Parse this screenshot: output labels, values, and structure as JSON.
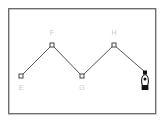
{
  "figure": {
    "background_color": "#ffffff",
    "frame": {
      "name": "outer-frame",
      "x": 8,
      "y": 8,
      "width": 148,
      "height": 106,
      "stroke_color": "#6e6e6e",
      "stroke_width": 1.4,
      "fill": "none"
    },
    "path": {
      "name": "zigzag-polyline",
      "stroke_color": "#555555",
      "stroke_width": 1,
      "points": [
        {
          "label": "E",
          "x": 21,
          "y": 76
        },
        {
          "label": "F",
          "x": 52,
          "y": 45
        },
        {
          "label": "G",
          "x": 82,
          "y": 76
        },
        {
          "label": "H",
          "x": 114,
          "y": 45
        },
        {
          "label": "",
          "x": 145,
          "y": 73
        }
      ]
    },
    "vertex_markers": {
      "name": "open-square-marker",
      "size": 4,
      "stroke_color": "#444444",
      "fill_color": "#ffffff",
      "stroke_width": 1,
      "positions": [
        {
          "x": 21,
          "y": 76
        },
        {
          "x": 52,
          "y": 45
        },
        {
          "x": 82,
          "y": 76
        },
        {
          "x": 114,
          "y": 45
        }
      ]
    },
    "labels": [
      {
        "text": "E",
        "x": 21,
        "y": 88,
        "color": "#c9c9c9"
      },
      {
        "text": "F",
        "x": 52,
        "y": 33,
        "color": "#c9c9c9"
      },
      {
        "text": "G",
        "x": 82,
        "y": 88,
        "color": "#c9c9c9"
      },
      {
        "text": "H",
        "x": 114,
        "y": 33,
        "color": "#c9c9c9"
      }
    ],
    "hanging_object": {
      "name": "hanging-bob",
      "anchor": {
        "x": 145,
        "y": 72
      },
      "anchor_size": 4,
      "anchor_color": "#111111",
      "bob_center": {
        "x": 145,
        "y": 81
      },
      "bob_rx": 3.4,
      "bob_ry": 6.0,
      "bob_fill": "#ffffff",
      "bob_stroke": "#111111",
      "inner_dot": {
        "x": 145,
        "y": 79,
        "r": 1.4,
        "fill": "#111111"
      },
      "base": {
        "x": 141.5,
        "y": 85,
        "width": 7,
        "height": 5,
        "fill": "#111111"
      }
    }
  }
}
